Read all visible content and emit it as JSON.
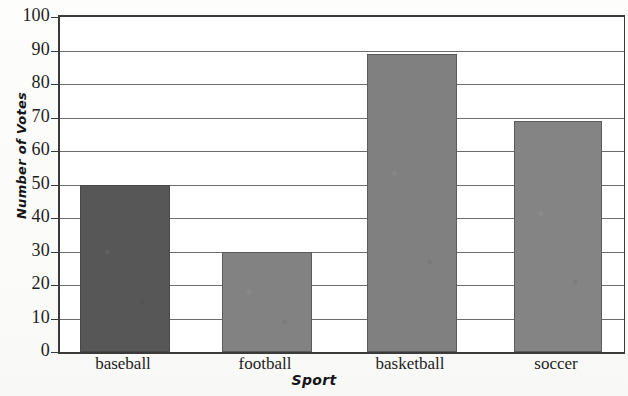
{
  "chart_data": {
    "type": "bar",
    "title": "",
    "xlabel": "Sport",
    "ylabel": "Number of Votes",
    "categories": [
      "baseball",
      "football",
      "basketball",
      "soccer"
    ],
    "values": [
      50,
      30,
      89,
      69
    ],
    "ylim": [
      0,
      100
    ],
    "ytick_step": 10,
    "yticks": [
      0,
      10,
      20,
      30,
      40,
      50,
      60,
      70,
      80,
      90,
      100
    ],
    "ytick_labels": [
      "0",
      "10",
      "20",
      "30",
      "40",
      "50",
      "60",
      "70",
      "80",
      "90",
      "100"
    ],
    "grid": true,
    "grid_axis": "y",
    "legend": false,
    "bar_colors": [
      "#575757",
      "#828282",
      "#808080",
      "#848484"
    ],
    "axis_color": "#3a3a3a",
    "gridline_color": "#6d6d6d",
    "plot_background": "#ffffff",
    "page_background": "#fdfdfb"
  }
}
